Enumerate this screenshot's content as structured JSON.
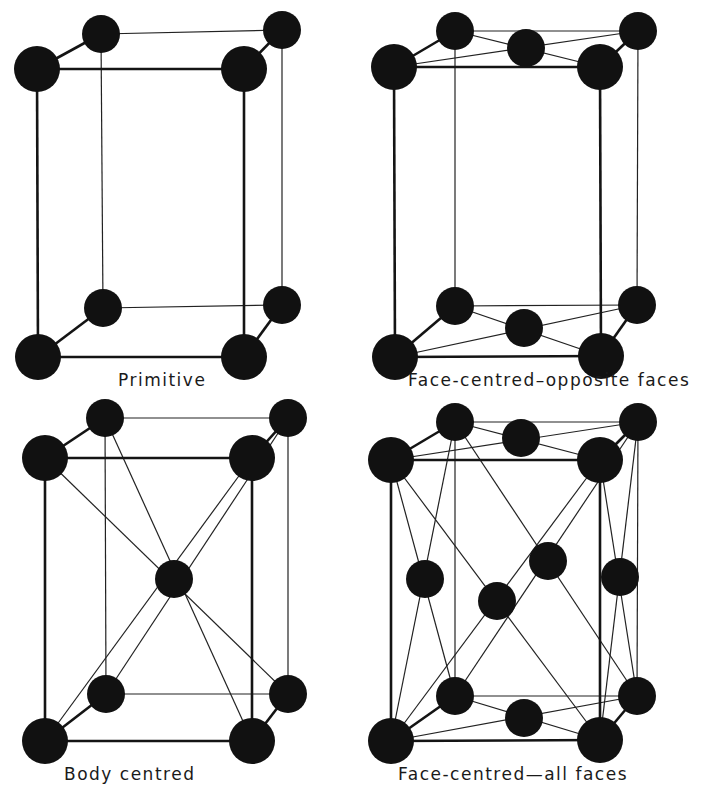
{
  "figure": {
    "panels": [
      {
        "id": "primitive",
        "label": "Primitive",
        "label_pos": [
          118,
          372
        ],
        "atoms": {
          "front": [
            [
              37,
              69
            ],
            [
              244,
              69
            ],
            [
              38,
              357
            ],
            [
              244,
              357
            ]
          ],
          "back": [
            [
              101,
              34
            ],
            [
              282,
              30
            ],
            [
              103,
              308
            ],
            [
              282,
              305
            ]
          ],
          "extra": []
        },
        "thin_lines": []
      },
      {
        "id": "face-centred-opposite",
        "label": "Face-centred–opposite faces",
        "label_pos": [
          408,
          372
        ],
        "atoms": {
          "front": [
            [
              394,
              67
            ],
            [
              600,
              67
            ],
            [
              395,
              357
            ],
            [
              601,
              356
            ]
          ],
          "back": [
            [
              455,
              31
            ],
            [
              638,
              31
            ],
            [
              455,
              306
            ],
            [
              637,
              305
            ]
          ],
          "extra": [
            [
              526,
              48
            ],
            [
              524,
              328
            ]
          ]
        },
        "thin_lines": [
          [
            [
              394,
              67
            ],
            [
              638,
              31
            ]
          ],
          [
            [
              455,
              31
            ],
            [
              600,
              67
            ]
          ],
          [
            [
              395,
              357
            ],
            [
              637,
              305
            ]
          ],
          [
            [
              455,
              306
            ],
            [
              601,
              356
            ]
          ]
        ]
      },
      {
        "id": "body-centred",
        "label": "Body centred",
        "label_pos": [
          64,
          765
        ],
        "atoms": {
          "front": [
            [
              45,
              458
            ],
            [
              252,
              458
            ],
            [
              45,
              741
            ],
            [
              252,
              741
            ]
          ],
          "back": [
            [
              105,
              418
            ],
            [
              288,
              418
            ],
            [
              106,
              694
            ],
            [
              288,
              694
            ]
          ],
          "extra": [
            [
              174,
              579
            ]
          ]
        },
        "thin_lines": [
          [
            [
              45,
              458
            ],
            [
              288,
              694
            ]
          ],
          [
            [
              105,
              418
            ],
            [
              252,
              741
            ]
          ],
          [
            [
              252,
              458
            ],
            [
              45,
              741
            ]
          ],
          [
            [
              288,
              418
            ],
            [
              106,
              694
            ]
          ]
        ]
      },
      {
        "id": "face-centred-all",
        "label": "Face-centred—all faces",
        "label_pos": [
          398,
          765
        ],
        "atoms": {
          "front": [
            [
              391,
              460
            ],
            [
              600,
              460
            ],
            [
              391,
              741
            ],
            [
              600,
              740
            ]
          ],
          "back": [
            [
              455,
              422
            ],
            [
              638,
              422
            ],
            [
              455,
              696
            ],
            [
              637,
              696
            ]
          ],
          "extra": [
            [
              521,
              438
            ],
            [
              524,
              718
            ],
            [
              425,
              579
            ],
            [
              497,
              601
            ],
            [
              548,
              561
            ],
            [
              620,
              577
            ]
          ]
        },
        "thin_lines": [
          [
            [
              391,
              460
            ],
            [
              638,
              422
            ]
          ],
          [
            [
              455,
              422
            ],
            [
              600,
              460
            ]
          ],
          [
            [
              391,
              741
            ],
            [
              637,
              696
            ]
          ],
          [
            [
              455,
              696
            ],
            [
              600,
              740
            ]
          ],
          [
            [
              391,
              460
            ],
            [
              600,
              740
            ]
          ],
          [
            [
              391,
              741
            ],
            [
              600,
              460
            ]
          ],
          [
            [
              455,
              422
            ],
            [
              637,
              696
            ]
          ],
          [
            [
              638,
              422
            ],
            [
              455,
              696
            ]
          ],
          [
            [
              391,
              460
            ],
            [
              455,
              696
            ]
          ],
          [
            [
              455,
              422
            ],
            [
              391,
              741
            ]
          ],
          [
            [
              600,
              460
            ],
            [
              637,
              696
            ]
          ],
          [
            [
              638,
              422
            ],
            [
              600,
              740
            ]
          ]
        ]
      }
    ],
    "atom_radius_front": 23,
    "atom_radius_back": 19,
    "atom_radius_extra": 19
  }
}
